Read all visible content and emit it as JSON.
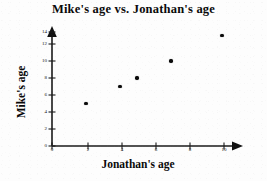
{
  "chart_data": {
    "type": "scatter",
    "title": "Mike's age vs. Jonathan's age",
    "xlabel": "Jonathan's age",
    "ylabel": "Mike's age",
    "x": [
      2,
      4,
      5,
      7,
      10
    ],
    "y": [
      5,
      7,
      8,
      10,
      13
    ],
    "points": [
      {
        "x": 2,
        "y": 5
      },
      {
        "x": 4,
        "y": 7
      },
      {
        "x": 5,
        "y": 8
      },
      {
        "x": 7,
        "y": 10
      },
      {
        "x": 10,
        "y": 13
      }
    ],
    "xlim": [
      0,
      11
    ],
    "ylim": [
      0,
      14.5
    ],
    "xticks": [
      0,
      2,
      4,
      6,
      8,
      10
    ],
    "xtick_labels": [
      "0",
      "2",
      "4",
      "6",
      "8",
      "10"
    ],
    "yticks": [
      0,
      2,
      4,
      6,
      8,
      10,
      12,
      14
    ],
    "ytick_labels": [
      "0",
      "2",
      "4",
      "6",
      "8",
      "10",
      "12",
      "14"
    ],
    "grid": false,
    "legend": null,
    "marker_color": "#0b0b0b",
    "axis_color": "#1a1a1a",
    "background": "#fdfdfd",
    "axis_arrows": {
      "x": "right",
      "y": "up"
    }
  }
}
